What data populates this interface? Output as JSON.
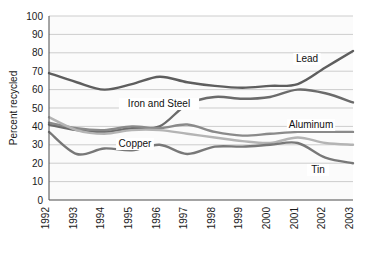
{
  "chart_data": {
    "type": "line",
    "title": "",
    "xlabel": "",
    "ylabel": "Percent recycled",
    "ylim": [
      0,
      100
    ],
    "ytick_step": 10,
    "grid": true,
    "legend": "inline-labels",
    "x": [
      "1992",
      "1993",
      "1994",
      "1995",
      "1996",
      "1997",
      "1998",
      "1999",
      "2000",
      "2001",
      "2002",
      "2003"
    ],
    "ytick_labels": [
      "100",
      "90",
      "80",
      "70",
      "60",
      "50",
      "40",
      "30",
      "20",
      "10",
      "0"
    ],
    "series": [
      {
        "name": "Lead",
        "label": "Lead",
        "color": "#5e5e5e",
        "values": [
          69,
          64,
          60,
          63,
          67,
          64,
          62,
          61,
          62,
          63,
          72,
          81
        ]
      },
      {
        "name": "Iron and Steel",
        "label": "Iron and Steel",
        "color": "#6b6b6b",
        "values": [
          41,
          38,
          37,
          39,
          40,
          52,
          56,
          55,
          56,
          60,
          58,
          53
        ]
      },
      {
        "name": "Aluminum",
        "label": "Aluminum",
        "color": "#8a8a8a",
        "values": [
          42,
          39,
          38,
          40,
          39,
          41,
          37,
          35,
          36,
          37,
          37,
          37
        ]
      },
      {
        "name": "Copper",
        "label": "Copper",
        "color": "#b4b4b4",
        "values": [
          45,
          38,
          36,
          38,
          38,
          36,
          34,
          32,
          31,
          34,
          31,
          30
        ]
      },
      {
        "name": "Tin",
        "label": "Tin",
        "color": "#787878",
        "values": [
          37,
          25,
          28,
          27,
          30,
          25,
          29,
          29,
          30,
          31,
          23,
          20
        ]
      }
    ],
    "annotations": [
      {
        "text": "Lead",
        "x_px": 307,
        "y_px": 62
      },
      {
        "text": "Iron and Steel",
        "x_px": 159,
        "y_px": 107
      },
      {
        "text": "Aluminum",
        "x_px": 311,
        "y_px": 128
      },
      {
        "text": "Copper",
        "x_px": 135,
        "y_px": 147
      },
      {
        "text": "Tin",
        "x_px": 318,
        "y_px": 173
      }
    ]
  }
}
